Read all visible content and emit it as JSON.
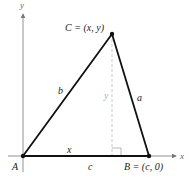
{
  "figure": {
    "axes": {
      "x_label": "x",
      "y_label": "y"
    },
    "vertices": {
      "A": {
        "label": "A"
      },
      "B": {
        "label": "B = (c, 0)"
      },
      "C": {
        "label": "C = (x, y)"
      }
    },
    "sides": {
      "a": "a",
      "b": "b",
      "c": "c"
    },
    "segments": {
      "x_base": "x",
      "height": "y"
    },
    "colors": {
      "triangle": "#111111",
      "axes": "#777777",
      "height_dashed": "#bbbbbb"
    }
  }
}
